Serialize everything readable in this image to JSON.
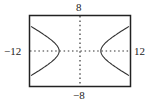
{
  "chart_data": {
    "type": "line",
    "title": "",
    "xlabel": "",
    "ylabel": "",
    "xlim": [
      -12,
      12
    ],
    "ylim": [
      -8,
      8
    ],
    "tick_labels": {
      "x_min": "−12",
      "x_max": "12",
      "y_min": "−8",
      "y_max": "8"
    },
    "grid": false,
    "axes_ticks": "dotted axes with unit ticks",
    "series": [
      {
        "name": "hyperbola x^2/25 - y^2/7 = 1 (right branch)",
        "x": [
          12,
          10,
          8,
          6,
          5,
          6,
          8,
          10,
          12
        ],
        "y": [
          5.77,
          4.58,
          3.3,
          1.75,
          0,
          -1.75,
          -3.3,
          -4.58,
          -5.77
        ]
      },
      {
        "name": "hyperbola x^2/25 - y^2/7 = 1 (left branch)",
        "x": [
          -12,
          -10,
          -8,
          -6,
          -5,
          -6,
          -8,
          -10,
          -12
        ],
        "y": [
          5.77,
          4.58,
          3.3,
          1.75,
          0,
          -1.75,
          -3.3,
          -4.58,
          -5.77
        ]
      }
    ]
  },
  "labels": {
    "top": "8",
    "bottom": "−8",
    "left": "−12",
    "right": "12"
  }
}
